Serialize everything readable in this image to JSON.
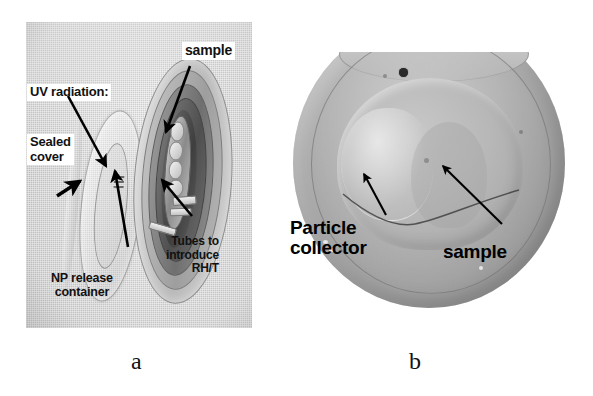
{
  "figure": {
    "panels": [
      {
        "id": "a",
        "caption": "a",
        "type": "photograph-schematic",
        "description": "exposure chamber shown open with sealed cover and chamber body",
        "labels": [
          {
            "name": "sample",
            "text": "sample",
            "style": "white-box"
          },
          {
            "name": "uv-radiation",
            "text": "UV radiation:",
            "style": "white-box"
          },
          {
            "name": "sealed-cover",
            "text": "Sealed\ncover",
            "line1": "Sealed",
            "line2": "cover",
            "style": "white-box"
          },
          {
            "name": "np-release-container",
            "text": "NP release container",
            "line1": "NP release",
            "line2": "container",
            "style": "plain"
          },
          {
            "name": "tubes-to-introduce",
            "text": "Tubes to introduce RH/T",
            "line1": "Tubes to",
            "line2": "introduce",
            "line3": "RH/T",
            "style": "plain"
          }
        ]
      },
      {
        "id": "b",
        "caption": "b",
        "type": "photograph",
        "description": "top view of the circular chamber interior",
        "labels": [
          {
            "name": "particle-collector",
            "text": "Particle collector",
            "line1": "Particle",
            "line2": "collector",
            "style": "plain-bold"
          },
          {
            "name": "sample",
            "text": "sample",
            "style": "plain-bold"
          }
        ]
      }
    ]
  },
  "colors": {
    "page_background": "#ffffff",
    "panel_a_background": "#c9c9c9",
    "label_box_background": "#ffffff",
    "text": "#111111",
    "arrow": "#000000",
    "disc_mid_gray": "#b0b0b0",
    "disc_dark_gray": "#8f8f8f"
  }
}
